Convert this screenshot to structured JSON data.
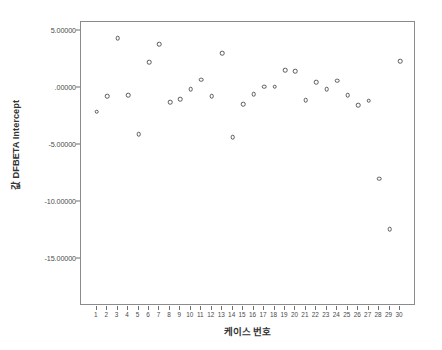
{
  "chart_data": {
    "type": "scatter",
    "title": "",
    "xlabel": "케이스 번호",
    "ylabel": "DFBETA Intercept",
    "ylabel_prefix": "값",
    "xlim": [
      0.5,
      30.5
    ],
    "ylim": [
      -15.0,
      7.0
    ],
    "grid": false,
    "legend": null,
    "x": [
      1,
      2,
      3,
      4,
      5,
      6,
      7,
      8,
      9,
      10,
      11,
      12,
      13,
      14,
      15,
      16,
      17,
      18,
      19,
      20,
      21,
      22,
      23,
      24,
      25,
      26,
      27,
      28,
      29,
      30
    ],
    "categories": [
      "1",
      "2",
      "3",
      "4",
      "5",
      "6",
      "7",
      "8",
      "9",
      "10",
      "11",
      "12",
      "13",
      "14",
      "15",
      "16",
      "17",
      "18",
      "19",
      "20",
      "21",
      "22",
      "23",
      "24",
      "25",
      "26",
      "27",
      "28",
      "29",
      "30"
    ],
    "values": [
      -2.1,
      -0.75,
      4.33,
      -0.64,
      -4.06,
      2.23,
      3.83,
      -1.28,
      -1.02,
      -0.11,
      0.7,
      -0.72,
      3.05,
      -4.35,
      -1.46,
      -0.58,
      0.08,
      0.1,
      1.55,
      1.44,
      -1.08,
      0.48,
      -0.11,
      0.61,
      -0.64,
      -1.54,
      -1.14,
      -7.99,
      -12.42,
      2.31
    ],
    "ytick_values": [
      5.0,
      0.0,
      -5.0,
      -10.0,
      -15.0
    ],
    "ytick_labels": [
      "5.00000",
      ".00000",
      "-5.00000",
      "-10.00000",
      "-15.00000"
    ],
    "marker_style": "open-circle",
    "marker_color": "#585858"
  }
}
